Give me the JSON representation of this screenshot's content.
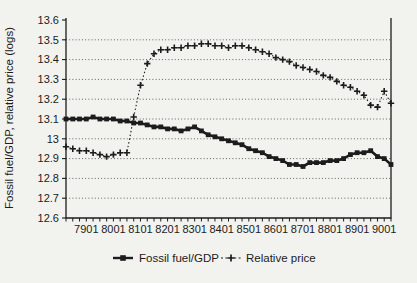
{
  "figure": {
    "background": "#f2f2ef",
    "ink": "#1c1c1c"
  },
  "chart_data": {
    "type": "line",
    "title": "",
    "xlabel": "",
    "ylabel": "Fossil fuel/GDP, relative price (logs)",
    "ylim": [
      12.6,
      13.6
    ],
    "y_ticks": [
      "12.6",
      "12.7",
      "12.8",
      "12.9",
      "13",
      "13.1",
      "13.2",
      "13.3",
      "13.4",
      "13.5",
      "13.6"
    ],
    "grid": "horizontal-dotted",
    "legend_position": "bottom-center",
    "x_tick_labels": [
      "7901",
      "8001",
      "8101",
      "8201",
      "8301",
      "8401",
      "8501",
      "8601",
      "8701",
      "8801",
      "8901",
      "9001"
    ],
    "categories": [
      "7802",
      "7803",
      "7804",
      "7901",
      "7902",
      "7903",
      "7904",
      "8001",
      "8002",
      "8003",
      "8004",
      "8101",
      "8102",
      "8103",
      "8104",
      "8201",
      "8202",
      "8203",
      "8204",
      "8301",
      "8302",
      "8303",
      "8304",
      "8401",
      "8402",
      "8403",
      "8404",
      "8501",
      "8502",
      "8503",
      "8504",
      "8601",
      "8602",
      "8603",
      "8604",
      "8701",
      "8702",
      "8703",
      "8704",
      "8801",
      "8802",
      "8803",
      "8804",
      "8901",
      "8902",
      "8903",
      "8904",
      "9001",
      "9002"
    ],
    "series": [
      {
        "name": "Fossil fuel/GDP",
        "marker": "square",
        "line": "solid",
        "values": [
          13.1,
          13.1,
          13.1,
          13.1,
          13.11,
          13.1,
          13.1,
          13.1,
          13.09,
          13.09,
          13.08,
          13.08,
          13.07,
          13.06,
          13.06,
          13.05,
          13.05,
          13.04,
          13.05,
          13.06,
          13.04,
          13.02,
          13.01,
          13.0,
          12.99,
          12.98,
          12.97,
          12.95,
          12.94,
          12.93,
          12.91,
          12.9,
          12.89,
          12.87,
          12.87,
          12.86,
          12.88,
          12.88,
          12.88,
          12.89,
          12.89,
          12.9,
          12.92,
          12.93,
          12.93,
          12.94,
          12.91,
          12.9,
          12.87
        ]
      },
      {
        "name": "Relative price",
        "marker": "plus",
        "line": "dotted",
        "values": [
          12.96,
          12.95,
          12.94,
          12.94,
          12.93,
          12.92,
          12.91,
          12.92,
          12.93,
          12.93,
          13.11,
          13.27,
          13.38,
          13.43,
          13.45,
          13.45,
          13.46,
          13.46,
          13.47,
          13.47,
          13.48,
          13.48,
          13.47,
          13.47,
          13.46,
          13.47,
          13.47,
          13.46,
          13.45,
          13.44,
          13.43,
          13.41,
          13.4,
          13.39,
          13.37,
          13.36,
          13.35,
          13.34,
          13.32,
          13.31,
          13.29,
          13.27,
          13.26,
          13.24,
          13.22,
          13.17,
          13.16,
          13.24,
          13.18
        ]
      }
    ]
  }
}
